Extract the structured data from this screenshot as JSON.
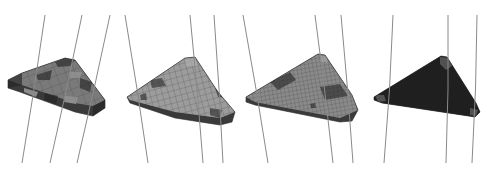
{
  "figure": {
    "background": "#ffffff",
    "line_color": "#8a8a8a",
    "panels": [
      {
        "id": "panel-1",
        "mesh_density": "coarse",
        "face_color": "#7a7a7a",
        "dark_patch_color": "#2a2a2a",
        "light_patch_color": "#9a9a9a",
        "cell_size": 9,
        "outline": "8,80 22,73 65,58 75,60 105,100 105,108 93,116 75,112 20,92 8,88",
        "top_face": "8,80 22,73 65,58 75,60 105,100 93,106 75,103 22,85",
        "dark_patches": [
          "8,80 22,73 22,85 8,88",
          "93,106 105,100 105,108 93,116",
          "55,62 65,58 75,60 70,66 58,67",
          "36,75 52,70 50,80 38,80",
          "80,78 92,82 90,92 80,88",
          "45,93 58,96 56,104 44,100"
        ],
        "light_patches": [
          "24,88 38,92 36,97 24,92",
          "65,96 78,97 76,104 64,102",
          "70,72 82,72 80,78 70,78"
        ],
        "curves": [
          [
            45,
            15,
            22,
            163
          ],
          [
            82,
            15,
            50,
            163
          ],
          [
            110,
            15,
            77,
            163
          ]
        ]
      },
      {
        "id": "panel-2",
        "mesh_density": "medium",
        "face_color": "#9c9c9c",
        "dark_patch_color": "#333333",
        "light_patch_color": "#b0b0b0",
        "cell_size": 6,
        "outline": "127,97 185,58 195,57 218,92 235,112 232,122 220,125 175,118 130,103",
        "top_face": "127,97 185,58 195,57 218,92 235,112 220,118 175,112 130,100",
        "dark_patches": [
          "150,80 162,78 166,86 152,88",
          "215,88 224,90 226,98 218,97",
          "140,95 146,93 147,100 141,100",
          "210,108 222,110 220,118 210,115"
        ],
        "light_patches": [
          "185,60 195,58 198,66 186,66"
        ],
        "curves": [
          [
            125,
            15,
            148,
            163
          ],
          [
            190,
            15,
            203,
            163
          ],
          [
            214,
            15,
            223,
            163
          ]
        ]
      },
      {
        "id": "panel-3",
        "mesh_density": "fine",
        "face_color": "#8a8a8a",
        "dark_patch_color": "#2e2e2e",
        "light_patch_color": "#a8a8a8",
        "cell_size": 4,
        "outline": "246,97 318,54 325,55 352,95 358,110 352,121 340,122 255,105 246,102",
        "top_face": "246,97 318,54 325,55 352,95 358,110 340,118 255,102",
        "dark_patches": [
          "270,82 290,72 296,80 278,90",
          "320,87 340,84 348,96 325,100",
          "310,104 315,103 316,108 311,108"
        ],
        "light_patches": [
          "320,56 326,56 328,62 320,62"
        ],
        "curves": [
          [
            243,
            15,
            268,
            163
          ],
          [
            315,
            15,
            333,
            163
          ],
          [
            341,
            15,
            353,
            163
          ]
        ]
      },
      {
        "id": "panel-4",
        "mesh_density": "very-fine",
        "face_color": "#222222",
        "dark_patch_color": "#1a1a1a",
        "light_patch_color": "#6e6e6e",
        "cell_size": 2,
        "outline": "374,97 441,56 447,57 476,103 480,112 475,117 382,103 374,100",
        "top_face": "374,97 441,56 447,57 476,103 480,112 475,117 382,103 374,100",
        "dark_patches": [],
        "light_patches": [
          "440,57 450,58 452,66 446,70 440,64",
          "375,95 384,95 386,101 378,102",
          "470,108 478,110 476,116 470,115"
        ],
        "curves": [
          [
            393,
            15,
            384,
            163
          ],
          [
            448,
            15,
            446,
            163
          ],
          [
            477,
            15,
            472,
            163
          ]
        ]
      }
    ]
  }
}
